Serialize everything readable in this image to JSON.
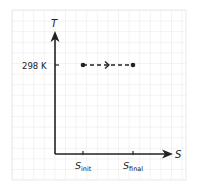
{
  "diagram": {
    "type": "T-S diagram",
    "x_axis_label": "S",
    "y_axis_label": "T",
    "y_tick_label": "298 K",
    "x_ticks": [
      {
        "symbol": "S",
        "subscript": "init"
      },
      {
        "symbol": "S",
        "subscript": "final"
      }
    ],
    "process": {
      "style": "dashed",
      "direction": "left-to-right",
      "start": "S_init",
      "end": "S_final",
      "temperature": "298 K"
    },
    "colors": {
      "ink": "#222222",
      "grid": "#e4e4e4",
      "background": "#ffffff"
    }
  }
}
